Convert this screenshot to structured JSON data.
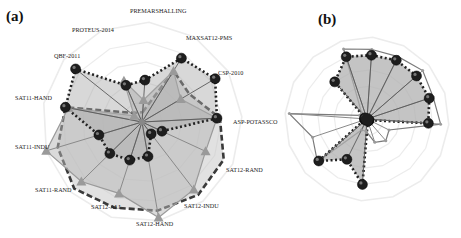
{
  "chart_data": [
    {
      "type": "radar",
      "panel_label": "(a)",
      "center": [
        142,
        122
      ],
      "radius": 100,
      "start_angle_deg": 4,
      "rings": 5,
      "grid": true,
      "axes": [
        "PREMARSHALLING",
        "MAXSAT12-PMS",
        "CSP-2010",
        "ASP-POTASSCO",
        "SAT12-RAND",
        "SAT12-INDU",
        "SAT12-HAND",
        "SAT12-ALL",
        "SAT11-RAND",
        "SAT11-INDU",
        "SAT11-HAND",
        "QBF-2011",
        "PROTEUS-2014"
      ],
      "series": [
        {
          "name": "series-dashed",
          "style": "dashed",
          "marker": "none",
          "fill": "#c9c9c9",
          "fill_opacity": 0.55,
          "stroke": "#3a3a3a",
          "values": [
            0.1,
            0.6,
            0.55,
            0.78,
            0.9,
            0.92,
            0.9,
            0.9,
            0.95,
            0.88,
            0.78,
            0.15,
            0.1
          ]
        },
        {
          "name": "series-triangle",
          "style": "solid",
          "marker": "triangle",
          "fill": "#b5b5b5",
          "fill_opacity": 0.5,
          "stroke": "#9a9a9a",
          "values": [
            0.22,
            0.6,
            0.45,
            0.75,
            0.7,
            0.85,
            0.97,
            0.75,
            0.85,
            1.0,
            0.75,
            0.1,
            0.45
          ]
        },
        {
          "name": "series-dotted",
          "style": "dotted",
          "marker": "circle",
          "fill": "#a8a8a8",
          "fill_opacity": 0.45,
          "stroke": "#222222",
          "values": [
            0.42,
            0.75,
            0.85,
            0.75,
            0.22,
            0.15,
            0.35,
            0.4,
            0.45,
            0.45,
            0.78,
            0.85,
            0.4
          ]
        }
      ]
    },
    {
      "type": "radar",
      "panel_label": "(b)",
      "center": [
        367,
        119
      ],
      "radius": 82,
      "start_angle_deg": 4,
      "rings": 5,
      "grid": true,
      "axes": [
        "",
        "",
        "",
        "",
        "",
        "",
        "",
        "",
        "",
        "",
        "",
        "",
        "",
        "",
        "",
        ""
      ],
      "series": [
        {
          "name": "series-line",
          "style": "solid",
          "marker": "small-dot",
          "fill": "none",
          "fill_opacity": 0,
          "stroke": "#7a7a7a",
          "values": [
            0.85,
            0.85,
            0.9,
            0.85,
            0.9,
            0.3,
            0.35,
            0.3,
            0.15,
            0.15,
            0.8,
            0.7,
            0.95,
            0.1,
            0.1,
            0.9
          ]
        },
        {
          "name": "series-dotted",
          "style": "dotted",
          "marker": "circle",
          "fill": "#b0b0b0",
          "fill_opacity": 0.75,
          "stroke": "#222222",
          "values": [
            0.78,
            0.8,
            0.8,
            0.8,
            0.75,
            0.03,
            0.03,
            0.03,
            0.8,
            0.55,
            0.78,
            0.03,
            0.03,
            0.03,
            0.6,
            0.8
          ]
        }
      ]
    }
  ]
}
